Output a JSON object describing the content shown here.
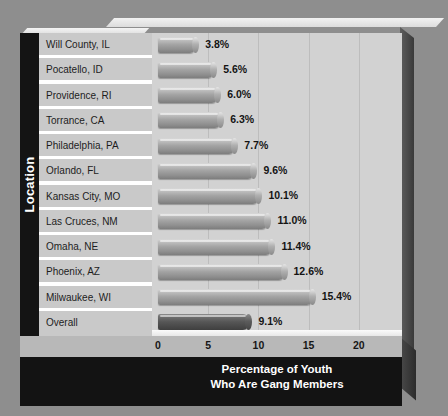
{
  "chart_data": {
    "type": "bar",
    "orientation": "horizontal",
    "title": "",
    "xlabel_lines": [
      "Percentage of Youth",
      "Who Are Gang Members"
    ],
    "ylabel": "Location",
    "categories": [
      "Will County, IL",
      "Pocatello, ID",
      "Providence, RI",
      "Torrance, CA",
      "Philadelphia, PA",
      "Orlando, FL",
      "Kansas City, MO",
      "Las Cruces, NM",
      "Omaha, NE",
      "Phoenix, AZ",
      "Milwaukee, WI",
      "Overall"
    ],
    "values": [
      3.8,
      5.6,
      6.0,
      6.3,
      7.7,
      9.6,
      10.1,
      11.0,
      11.4,
      12.6,
      15.4,
      9.1
    ],
    "value_labels": [
      "3.8%",
      "5.6%",
      "6.0%",
      "6.3%",
      "7.7%",
      "9.6%",
      "10.1%",
      "11.0%",
      "11.4%",
      "12.6%",
      "15.4%",
      "9.1%"
    ],
    "highlight_index": 11,
    "xlim": [
      0,
      23.5
    ],
    "xticks": [
      0,
      5,
      10,
      15,
      20
    ],
    "xtick_labels": [
      "0",
      "5",
      "10",
      "15",
      "20"
    ],
    "grid": "vertical",
    "legend": "none",
    "colors": {
      "bar": "#a3a3a3",
      "bar_highlight": "#565656",
      "plot_background": "#d2d2d2",
      "label_background": "#c9c9c9",
      "axis_band": "#b8b8b8",
      "title_band": "#131313",
      "page_background": "#8e8e8e"
    }
  }
}
